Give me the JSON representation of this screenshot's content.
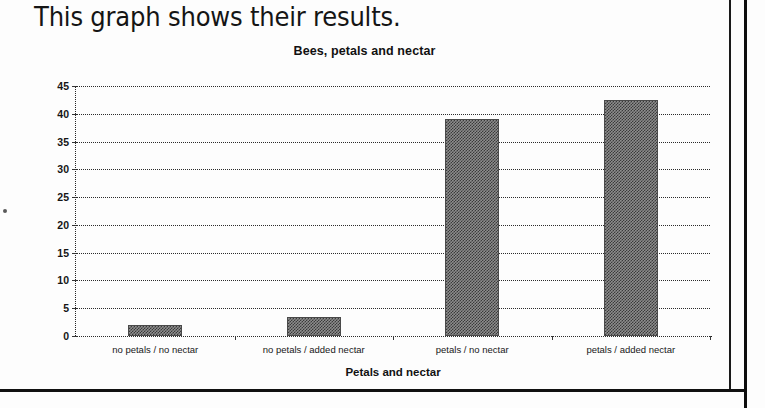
{
  "heading": "This graph shows their results.",
  "chart_data": {
    "type": "bar",
    "title": "Bees, petals and nectar",
    "xlabel": "Petals and nectar",
    "ylabel": "Number of visits",
    "categories": [
      "no petals / no nectar",
      "no petals / added nectar",
      "petals / no nectar",
      "petals / added nectar"
    ],
    "values": [
      2,
      3.5,
      39,
      42.5
    ],
    "ylim": [
      0,
      45
    ],
    "ytick_labels": [
      "0",
      "5",
      "10",
      "15",
      "20",
      "25",
      "30",
      "35",
      "40",
      "45"
    ],
    "ytick_values": [
      0,
      5,
      10,
      15,
      20,
      25,
      30,
      35,
      40,
      45
    ],
    "grid": true,
    "legend": "none",
    "bar_color": "#8d8d8d"
  }
}
